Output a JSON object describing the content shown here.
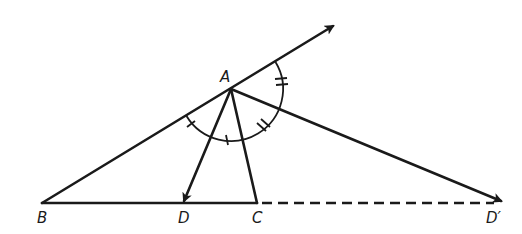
{
  "diagram": {
    "title": "",
    "points": {
      "A": {
        "label": "A",
        "x": 231,
        "y": 89
      },
      "B": {
        "label": "B",
        "x": 42,
        "y": 203
      },
      "D": {
        "label": "D",
        "x": 183,
        "y": 203
      },
      "C": {
        "label": "C",
        "x": 257,
        "y": 203
      },
      "Dprime": {
        "label": "D′",
        "x": 503,
        "y": 203
      }
    },
    "segments": [
      {
        "from": "B",
        "to": "C",
        "style": "solid"
      },
      {
        "from": "C",
        "to": "Dprime",
        "style": "dashed"
      },
      {
        "from": "A",
        "to": "C",
        "style": "solid"
      },
      {
        "from": "B",
        "to": "A",
        "style": "solid",
        "extends": "ray beyond A (arrow)"
      },
      {
        "from": "A",
        "to": "D",
        "style": "solid",
        "arrow": true
      },
      {
        "from": "A",
        "to": "Dprime",
        "style": "solid",
        "arrow": true
      }
    ],
    "angle_marks": [
      {
        "angle": "BAD",
        "ticks": 1
      },
      {
        "angle": "DAC",
        "ticks": 1
      },
      {
        "angle": "CAD'",
        "ticks": 2
      },
      {
        "angle": "D'A-exterior",
        "ticks": 2
      }
    ],
    "labels": {
      "A": "A",
      "B": "B",
      "D": "D",
      "C": "C",
      "Dprime": "D′"
    },
    "colors": {
      "ink": "#1a1a1a",
      "background": "#ffffff"
    }
  }
}
